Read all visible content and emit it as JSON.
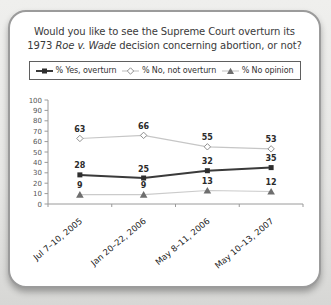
{
  "title": {
    "line1": "Would you like to see the Supreme Court overturn its",
    "line2_prefix": "1973 ",
    "line2_italic": "Roe v. Wade",
    "line2_suffix": " decision concerning abortion, or not?"
  },
  "legend": {
    "items": [
      {
        "label": "% Yes, overturn",
        "marker": "square"
      },
      {
        "label": "% No, not overturn",
        "marker": "diamond"
      },
      {
        "label": "% No opinion",
        "marker": "triangle"
      }
    ]
  },
  "chart_data": {
    "type": "line",
    "title": "Would you like to see the Supreme Court overturn its 1973 Roe v. Wade decision concerning abortion, or not?",
    "categories": [
      "Jul 7–10, 2005",
      "Jan 20–22, 2006",
      "May 8–11, 2006",
      "May 10–13, 2007"
    ],
    "series": [
      {
        "name": "% Yes, overturn",
        "values": [
          28,
          25,
          32,
          35
        ],
        "marker": "square",
        "marker_fill": "#2e2e2e",
        "marker_stroke": "#2e2e2e",
        "line_color": "#3a3a3a",
        "line_width": 2
      },
      {
        "name": "% No, not overturn",
        "values": [
          63,
          66,
          55,
          53
        ],
        "marker": "diamond",
        "marker_fill": "#ffffff",
        "marker_stroke": "#8f8f8f",
        "line_color": "#c6c6c6",
        "line_width": 1.2
      },
      {
        "name": "% No opinion",
        "values": [
          9,
          9,
          13,
          12
        ],
        "marker": "triangle",
        "marker_fill": "#6e6e6e",
        "marker_stroke": "#6e6e6e",
        "line_color": "#cbcbcb",
        "line_width": 1.2
      }
    ],
    "draw_order": [
      1,
      2,
      0
    ],
    "ylim": [
      0,
      100
    ],
    "ytick_step": 10,
    "grid": false,
    "legend_position": "top",
    "xlabel": "",
    "ylabel": ""
  },
  "colors": {
    "axis": "#9a9a9a",
    "tick_label": "#555555",
    "data_label": "#2b2b2b",
    "x_label": "#222222",
    "title_text": "#3a3a3a"
  }
}
